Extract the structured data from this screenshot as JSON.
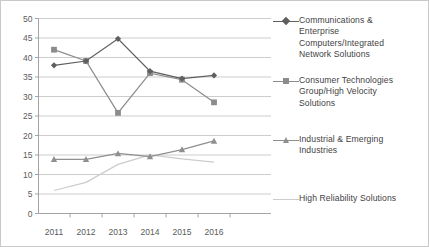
{
  "chart_data": {
    "type": "line",
    "title": "",
    "xlabel": "",
    "ylabel": "",
    "categories": [
      "2011",
      "2012",
      "2013",
      "2014",
      "2015",
      "2016"
    ],
    "x_tick_labels": [
      "2011",
      "2012",
      "2013",
      "2014",
      "2015",
      "2016"
    ],
    "y_tick_labels": [
      "0",
      "5",
      "10",
      "15",
      "20",
      "25",
      "30",
      "35",
      "40",
      "45",
      "50"
    ],
    "ylim": [
      0,
      50
    ],
    "y_step": 5,
    "grid": true,
    "legend_position": "right",
    "series": [
      {
        "name": "Communications & Enterprise Computers/Integrated Network Solutions",
        "marker": "diamond",
        "color": "#5f5f5f",
        "values": [
          38.0,
          39.1,
          44.8,
          36.5,
          34.6,
          35.4
        ]
      },
      {
        "name": "Consumer Technologies Group/High Velocity Solutions",
        "marker": "square",
        "color": "#8c8c8c",
        "values": [
          42.0,
          39.1,
          25.8,
          36.0,
          34.3,
          28.5
        ]
      },
      {
        "name": "Industrial & Emerging Industries",
        "marker": "triangle",
        "color": "#8f8f8f",
        "values": [
          13.9,
          13.9,
          15.4,
          14.6,
          16.4,
          18.6
        ]
      },
      {
        "name": "High Reliability Solutions",
        "marker": "none",
        "color": "#cccccc",
        "values": [
          5.9,
          8.0,
          12.6,
          15.0,
          14.0,
          13.2
        ]
      }
    ]
  },
  "legend": {
    "items": [
      {
        "label": "Communications &\nEnterprise\nComputers/Integrated\nNetwork Solutions",
        "marker": "diamond",
        "color": "#5f5f5f"
      },
      {
        "label": "Consumer Technologies\nGroup/High Velocity\nSolutions",
        "marker": "square",
        "color": "#8c8c8c"
      },
      {
        "label": "Industrial & Emerging\nIndustries",
        "marker": "triangle",
        "color": "#8f8f8f"
      },
      {
        "label": "High Reliability Solutions",
        "marker": "none",
        "color": "#cccccc"
      }
    ]
  }
}
